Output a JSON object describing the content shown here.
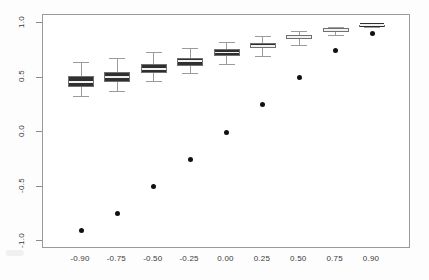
{
  "chart_data": {
    "type": "boxplot",
    "title": "",
    "xlabel": "",
    "ylabel": "",
    "xlim": [
      -1.125,
      1.125
    ],
    "ylim": [
      -1.07,
      1.07
    ],
    "grid": false,
    "legend": null,
    "y_ticks": [
      1.0,
      0.5,
      0.0,
      -0.5,
      -1.0
    ],
    "y_tick_labels": [
      "1.0",
      "0.5",
      "0.0",
      "-0.5",
      "-1.0"
    ],
    "x_tick_labels": [
      "-0.90",
      "-0.75",
      "-0.50",
      "-0.25",
      "0.00",
      "0.25",
      "0.50",
      "0.75",
      "0.90"
    ],
    "categories": [
      -0.9,
      -0.75,
      -0.5,
      -0.25,
      0.0,
      0.25,
      0.5,
      0.75,
      0.9
    ],
    "boxes": [
      {
        "category": "-0.90",
        "whisker_low": 0.33,
        "q1": 0.41,
        "median": 0.46,
        "q3": 0.51,
        "whisker_high": 0.64
      },
      {
        "category": "-0.75",
        "whisker_low": 0.38,
        "q1": 0.46,
        "median": 0.5,
        "q3": 0.55,
        "whisker_high": 0.68
      },
      {
        "category": "-0.50",
        "whisker_low": 0.47,
        "q1": 0.54,
        "median": 0.58,
        "q3": 0.62,
        "whisker_high": 0.73
      },
      {
        "category": "-0.25",
        "whisker_low": 0.54,
        "q1": 0.61,
        "median": 0.65,
        "q3": 0.68,
        "whisker_high": 0.77
      },
      {
        "category": "0.00",
        "whisker_low": 0.62,
        "q1": 0.7,
        "median": 0.73,
        "q3": 0.76,
        "whisker_high": 0.83
      },
      {
        "category": "0.25",
        "whisker_low": 0.7,
        "q1": 0.77,
        "median": 0.79,
        "q3": 0.82,
        "whisker_high": 0.88
      },
      {
        "category": "0.50",
        "whisker_low": 0.8,
        "q1": 0.85,
        "median": 0.87,
        "q3": 0.89,
        "whisker_high": 0.93
      },
      {
        "category": "0.75",
        "whisker_low": 0.89,
        "q1": 0.92,
        "median": 0.935,
        "q3": 0.95,
        "whisker_high": 0.965
      },
      {
        "category": "0.90",
        "whisker_low": 0.965,
        "q1": 0.975,
        "median": 0.98,
        "q3": 0.985,
        "whisker_high": 0.99
      }
    ],
    "points": {
      "name": "true value",
      "x": [
        -0.9,
        -0.75,
        -0.5,
        -0.25,
        0.0,
        0.25,
        0.5,
        0.75,
        0.9
      ],
      "values": [
        -0.9,
        -0.75,
        -0.5,
        -0.25,
        0.0,
        0.25,
        0.5,
        0.75,
        0.9
      ]
    }
  },
  "colors": {
    "box_fill": "#e9e9e9",
    "box_band": "#2f2f2f",
    "box_edge": "#707070",
    "whisker": "#9b9b9b",
    "point": "#111111",
    "frame": "#9a9a9a",
    "text": "#3a3a3a"
  }
}
